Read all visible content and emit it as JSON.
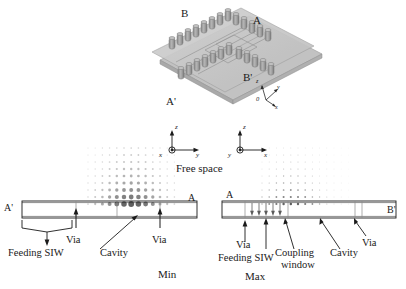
{
  "figure": {
    "type": "antenna-structure-and-field-diagram",
    "views": {
      "top_3d": {
        "name": "3d-perspective-view",
        "corner_labels": [
          {
            "id": "B",
            "text": "B",
            "x": 181,
            "y": 12
          },
          {
            "id": "A",
            "text": "A",
            "x": 253,
            "y": 19
          },
          {
            "id": "Bp",
            "text": "B'",
            "x": 243,
            "y": 76
          },
          {
            "id": "Ap",
            "text": "A'",
            "x": 166,
            "y": 99
          }
        ],
        "axis_triad": {
          "name": "3d-axis-indicator",
          "origin_label": "0",
          "axes": [
            "z",
            "y",
            "x"
          ],
          "x": 262,
          "y": 88
        }
      },
      "axis_pair": {
        "name": "coordinate-axis-pair",
        "left": {
          "vertical": "z",
          "left_axis": "x",
          "right_axis": "y",
          "origin": "0"
        },
        "right": {
          "vertical": "z",
          "left_axis": "y",
          "right_axis": "x",
          "origin": "0"
        },
        "caption": "Free space"
      },
      "bottom_left": {
        "name": "cross-section-min",
        "caption": "Min",
        "end_label_left": "A'",
        "end_label_right": "A",
        "annotations": [
          {
            "id": "feeding-siw",
            "text": "Feeding SIW"
          },
          {
            "id": "via-left",
            "text": "Via"
          },
          {
            "id": "cavity",
            "text": "Cavity"
          },
          {
            "id": "via-right",
            "text": "Via"
          }
        ]
      },
      "bottom_right": {
        "name": "cross-section-max",
        "caption": "Max",
        "end_label_left": "A",
        "end_label_right": "B'",
        "annotations": [
          {
            "id": "via-left",
            "text": "Via"
          },
          {
            "id": "feeding-siw",
            "text": "Feeding SIW"
          },
          {
            "id": "coupling-window",
            "text": "Coupling\nwindow"
          },
          {
            "id": "coupling-window-line1",
            "text": "Coupling"
          },
          {
            "id": "coupling-window-line2",
            "text": "window"
          },
          {
            "id": "cavity",
            "text": "Cavity"
          },
          {
            "id": "via-right",
            "text": "Via"
          }
        ]
      }
    },
    "colors": {
      "substrate": "#c9c9c9",
      "substrate_edge": "#9a9a9a",
      "via": "#9e9e9e",
      "via_edge": "#6e6e6e",
      "line": "#1a1a1a",
      "field_dot": "#555555",
      "field_dot_faint": "#b8b8b8"
    }
  },
  "chart_data": {
    "type": "heatmap",
    "panels": [
      {
        "name": "Min",
        "xlabel": "",
        "ylabel": "",
        "grid": true,
        "legend": "none",
        "note": "Strong field concentration centred over the cavity aperture, decaying with height",
        "dot_grid": {
          "cols": 13,
          "rows": 9,
          "pitch_x": 7.2,
          "pitch_y": 7.0,
          "origin_x": 88,
          "origin_y": 148,
          "peak_col": 6,
          "peak_row": 8,
          "max_radius": 2.9,
          "min_radius": 0.5
        }
      },
      {
        "name": "Max",
        "xlabel": "",
        "ylabel": "",
        "grid": true,
        "legend": "none",
        "note": "Weak diffuse field above the slab; energy confined inside the guide",
        "dot_grid": {
          "cols": 13,
          "rows": 9,
          "pitch_x": 7.2,
          "pitch_y": 7.0,
          "origin_x": 262,
          "origin_y": 148,
          "peak_col": 4,
          "peak_row": 8,
          "max_radius": 1.25,
          "min_radius": 0.35
        }
      }
    ]
  }
}
